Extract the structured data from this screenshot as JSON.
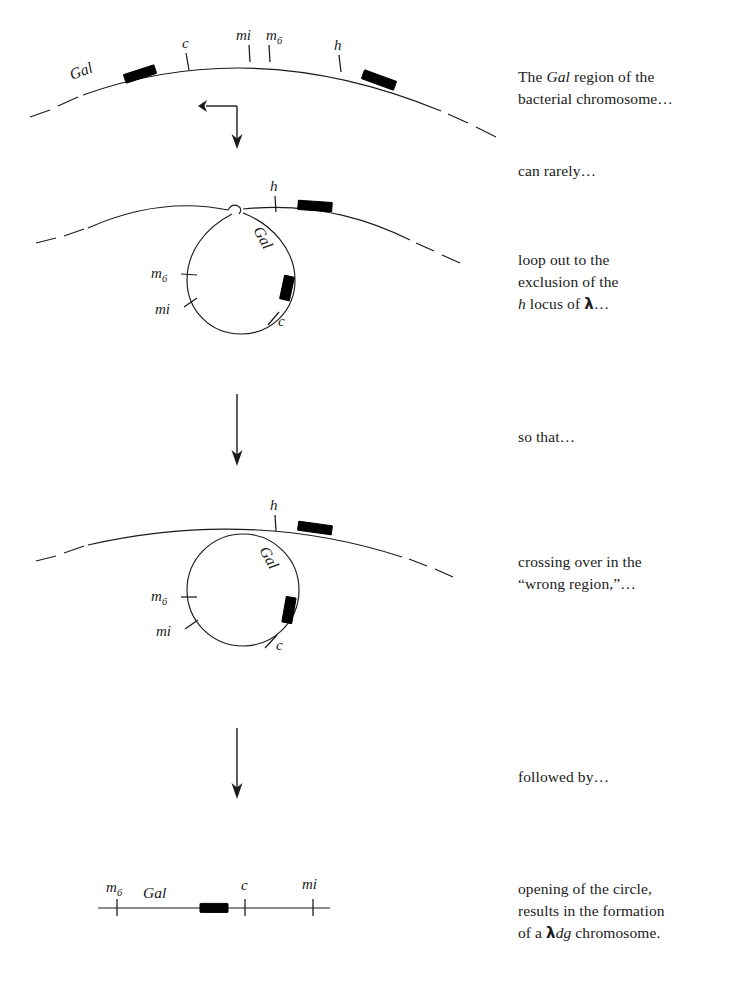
{
  "figure": {
    "title_visible": false,
    "background_color": "#ffffff",
    "ink_color": "#1a1a1a",
    "prophage_color": "#000000"
  },
  "captions": [
    {
      "id": "caption-1",
      "lines": [
        "The Gal region of the",
        "bacterial chromosome…"
      ],
      "italic_terms": [
        "Gal"
      ]
    },
    {
      "id": "caption-2",
      "lines": [
        "can rarely…"
      ],
      "italic_terms": []
    },
    {
      "id": "caption-3",
      "lines": [
        "loop out to the",
        "exclusion of the",
        "h locus of λ…"
      ],
      "italic_terms": [
        "h"
      ]
    },
    {
      "id": "caption-4",
      "lines": [
        "so that…"
      ],
      "italic_terms": []
    },
    {
      "id": "caption-5",
      "lines": [
        "crossing over in the",
        "“wrong region,”…"
      ],
      "italic_terms": []
    },
    {
      "id": "caption-6",
      "lines": [
        "followed by…"
      ],
      "italic_terms": []
    },
    {
      "id": "caption-7",
      "lines": [
        "opening of the circle,",
        "results in the formation",
        "of a λdg chromosome."
      ],
      "italic_terms": [
        "dg"
      ]
    }
  ],
  "panels": [
    {
      "id": "panel-1",
      "name": "bacterial-chromosome-arc",
      "description": "Gal region of the bacterial chromosome",
      "loci": [
        {
          "label": "Gal",
          "kind": "region"
        },
        {
          "label": "c",
          "kind": "tick"
        },
        {
          "label": "mi",
          "kind": "tick"
        },
        {
          "label": "m",
          "sub": "6",
          "kind": "tick"
        },
        {
          "label": "h",
          "kind": "tick"
        }
      ],
      "prophage_blocks": 2
    },
    {
      "id": "panel-2",
      "name": "loop-out-arc",
      "description": "Gal region looped out excluding h locus",
      "loci": [
        {
          "label": "h",
          "kind": "tick"
        },
        {
          "label": "Gal",
          "kind": "region"
        },
        {
          "label": "m",
          "sub": "6",
          "kind": "tick"
        },
        {
          "label": "mi",
          "kind": "tick"
        },
        {
          "label": "c",
          "kind": "tick"
        }
      ],
      "prophage_blocks": 2
    },
    {
      "id": "panel-3",
      "name": "excised-circle-arc",
      "description": "Circle excised after crossing over in the wrong region",
      "loci": [
        {
          "label": "h",
          "kind": "tick"
        },
        {
          "label": "Gal",
          "kind": "region"
        },
        {
          "label": "m",
          "sub": "6",
          "kind": "tick"
        },
        {
          "label": "mi",
          "kind": "tick"
        },
        {
          "label": "c",
          "kind": "tick"
        }
      ],
      "prophage_blocks": 2
    },
    {
      "id": "panel-4",
      "name": "lambda-dg-linear-chromosome",
      "description": "Opened circle forming the lambda-dg chromosome",
      "loci": [
        {
          "label": "m",
          "sub": "6",
          "kind": "tick"
        },
        {
          "label": "Gal",
          "kind": "region"
        },
        {
          "label": "c",
          "kind": "tick"
        },
        {
          "label": "mi",
          "kind": "tick"
        }
      ],
      "prophage_blocks": 1
    }
  ],
  "arrows": [
    {
      "id": "arrow-1",
      "direction": "down"
    },
    {
      "id": "arrow-2",
      "direction": "down"
    },
    {
      "id": "arrow-3",
      "direction": "down"
    }
  ],
  "labels": {
    "gal": "Gal",
    "c": "c",
    "mi": "mi",
    "m": "m",
    "m_sub": "6",
    "h": "h"
  }
}
